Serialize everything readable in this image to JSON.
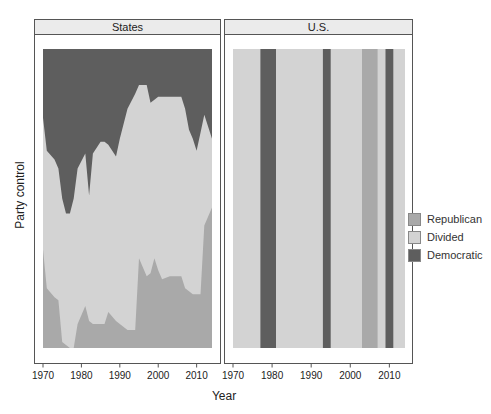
{
  "chart_data": {
    "type": "area",
    "title": "",
    "xlabel": "Year",
    "ylabel": "Party control",
    "xlim": [
      1970,
      2014
    ],
    "x_ticks": [
      1970,
      1980,
      1990,
      2000,
      2010
    ],
    "legend": {
      "position": "right",
      "entries": [
        {
          "name": "Republican",
          "color": "#a9a9a9"
        },
        {
          "name": "Divided",
          "color": "#d3d3d3"
        },
        {
          "name": "Democratic",
          "color": "#5e5e5e"
        }
      ]
    },
    "panels": [
      {
        "name": "States",
        "type": "stacked_area",
        "note": "Proportion of states under each type of party control (estimated from pixels)",
        "years": [
          1970,
          1971,
          1973,
          1974,
          1975,
          1976,
          1977,
          1978,
          1979,
          1981,
          1982,
          1983,
          1985,
          1986,
          1987,
          1989,
          1990,
          1992,
          1994,
          1995,
          1997,
          1998,
          1999,
          2000,
          2001,
          2003,
          2006,
          2007,
          2008,
          2009,
          2010,
          2011,
          2012,
          2014
        ],
        "republican": [
          0.33,
          0.2,
          0.17,
          0.16,
          0.02,
          0.01,
          0.0,
          0.0,
          0.08,
          0.14,
          0.09,
          0.08,
          0.08,
          0.08,
          0.12,
          0.09,
          0.08,
          0.06,
          0.06,
          0.3,
          0.24,
          0.25,
          0.3,
          0.26,
          0.23,
          0.24,
          0.24,
          0.2,
          0.19,
          0.18,
          0.18,
          0.18,
          0.41,
          0.47
        ],
        "democratic": [
          0.23,
          0.34,
          0.37,
          0.4,
          0.5,
          0.55,
          0.55,
          0.5,
          0.4,
          0.35,
          0.49,
          0.35,
          0.31,
          0.31,
          0.32,
          0.36,
          0.3,
          0.2,
          0.15,
          0.12,
          0.12,
          0.18,
          0.17,
          0.16,
          0.16,
          0.16,
          0.16,
          0.2,
          0.27,
          0.3,
          0.34,
          0.28,
          0.22,
          0.3
        ]
      },
      {
        "name": "U.S.",
        "type": "timeline_bands",
        "default": "Divided",
        "bands": [
          {
            "start": 1977,
            "end": 1981,
            "control": "Democratic"
          },
          {
            "start": 1993,
            "end": 1995,
            "control": "Democratic"
          },
          {
            "start": 2003,
            "end": 2007,
            "control": "Republican"
          },
          {
            "start": 2009,
            "end": 2011,
            "control": "Democratic"
          }
        ]
      }
    ]
  },
  "panels": {
    "states_title": "States",
    "us_title": "U.S."
  },
  "axes": {
    "xlabel": "Year",
    "ylabel": "Party control",
    "ticks": [
      "1970",
      "1980",
      "1990",
      "2000",
      "2010"
    ]
  },
  "legend": {
    "items": [
      {
        "label": "Republican",
        "color": "#a9a9a9"
      },
      {
        "label": "Divided",
        "color": "#d3d3d3"
      },
      {
        "label": "Democratic",
        "color": "#5e5e5e"
      }
    ]
  }
}
